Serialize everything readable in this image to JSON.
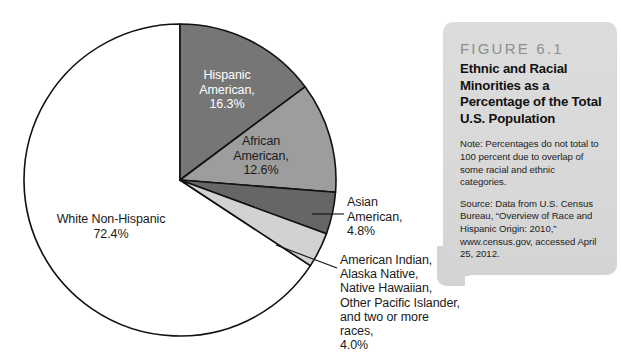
{
  "chart_data": {
    "type": "pie",
    "title": "Ethnic and Racial Minorities as a Percentage of the Total U.S. Population",
    "categories": [
      "Hispanic American",
      "African American",
      "Asian American",
      "American Indian, Alaska Native, Native Hawaiian, Other Pacific Islander, and two or more races",
      "White Non-Hispanic"
    ],
    "values": [
      16.3,
      12.6,
      4.8,
      4.0,
      72.4
    ],
    "value_suffix": "%",
    "total": 110.1,
    "legend": "none",
    "start_angle_deg": 0,
    "direction": "clockwise",
    "slices": [
      {
        "name": "hispanic-american",
        "label_lines": "Hispanic\nAmerican,\n16.3%",
        "value": 16.3,
        "color": "#767676",
        "label_color": "#ffffff",
        "angle_deg": 53.3
      },
      {
        "name": "african-american",
        "label_lines": "African\nAmerican,\n12.6%",
        "value": 12.6,
        "color": "#9d9d9d",
        "label_color": "#1a1a1a",
        "angle_deg": 41.2
      },
      {
        "name": "asian-american",
        "label_lines": "Asian\nAmerican,\n4.8%",
        "value": 4.8,
        "color": "#666666",
        "label_color": "#1a1a1a",
        "angle_deg": 15.7
      },
      {
        "name": "american-indian-alaska-native-other",
        "label_lines": "American Indian,\nAlaska Native,\nNative Hawaiian,\nOther Pacific Islander,\nand two or more races,\n4.0%",
        "value": 4.0,
        "color": "#d2d2d2",
        "label_color": "#1a1a1a",
        "angle_deg": 13.1
      },
      {
        "name": "white-non-hispanic",
        "label_lines": "White Non-Hispanic\n72.4%",
        "value": 72.4,
        "color": "#ffffff",
        "label_color": "#1a1a1a",
        "angle_deg": 236.7
      }
    ],
    "stroke_color": "#111111",
    "grid": false,
    "xlabel": "",
    "ylabel": ""
  },
  "figure_box": {
    "figure_number": "FIGURE 6.1",
    "title": "Ethnic and Racial Minorities as a Percentage of the Total U.S. Population",
    "note": "Note: Percentages do not total to 100 percent due to overlap of some racial and ethnic categories.",
    "source": "Source: Data from U.S. Census Bureau, “Overview of Race and Hispanic Origin: 2010,” www.census.gov, accessed April 25, 2012.",
    "background_color": "#d6d6d6",
    "number_color": "#8e8e8e"
  }
}
